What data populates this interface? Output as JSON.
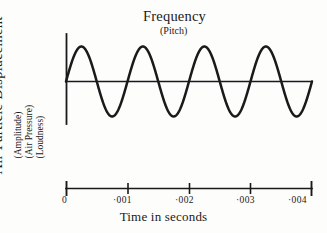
{
  "figure": {
    "title": "Frequency",
    "subtitle": "(Pitch)",
    "y_axis": {
      "main_label": "Air Particle Displacement",
      "sub_labels": [
        "(Amplitude)",
        "(Air Pressure)",
        "(Loudness)"
      ]
    },
    "x_axis": {
      "caption": "Time in seconds",
      "tick_labels": [
        "0",
        "·001",
        "·002",
        "·003",
        "·004"
      ]
    },
    "colors": {
      "ink": "#1a1a1a",
      "paper": "#fdfdfc"
    }
  },
  "chart_data": {
    "type": "line",
    "title": "Frequency",
    "subtitle": "(Pitch)",
    "xlabel": "Time in seconds",
    "ylabel": "Air Particle Displacement (Amplitude) (Air Pressure) (Loudness)",
    "grid": false,
    "legend": "none",
    "xlim": [
      0,
      0.004
    ],
    "ylim": [
      -1,
      1
    ],
    "xticks": [
      0,
      0.001,
      0.002,
      0.003,
      0.004
    ],
    "xticklabels": [
      "0",
      "·001",
      "·002",
      "·003",
      "·004"
    ],
    "yticks": [],
    "waveform": {
      "shape": "sine",
      "amplitude": 1,
      "cycles": 4,
      "period_seconds": 0.001,
      "frequency_hz": 1000,
      "phase": 0,
      "baseline_value": 0
    },
    "x": [
      0,
      0.00025,
      0.0005,
      0.00075,
      0.001,
      0.00125,
      0.0015,
      0.00175,
      0.002,
      0.00225,
      0.0025,
      0.00275,
      0.003,
      0.00325,
      0.0035,
      0.00375,
      0.004
    ],
    "y": [
      0,
      1,
      0,
      -1,
      0,
      1,
      0,
      -1,
      0,
      1,
      0,
      -1,
      0,
      1,
      0,
      -1,
      0
    ]
  }
}
